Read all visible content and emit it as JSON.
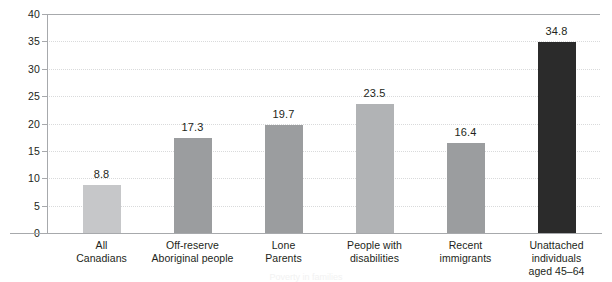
{
  "chart_data": {
    "type": "bar",
    "title": "",
    "subtitle": "",
    "xlabel": "",
    "ylabel": "",
    "ylim": [
      0,
      40
    ],
    "ytick_step": 5,
    "yticks": [
      "40",
      "35",
      "30",
      "25",
      "20",
      "15",
      "10",
      "5",
      "0"
    ],
    "grid": true,
    "grid_axis": "y",
    "legend": false,
    "categories": [
      "All Canadians",
      "Off-reserve Aboriginal people",
      "Lone Parents",
      "People with disabilities",
      "Recent immigrants",
      "Unattached individuals aged 45–64"
    ],
    "category_lines": [
      [
        "All",
        "Canadians"
      ],
      [
        "Off-reserve",
        "Aboriginal people"
      ],
      [
        "Lone",
        "Parents"
      ],
      [
        "People with",
        "disabilities"
      ],
      [
        "Recent",
        "immigrants"
      ],
      [
        "Unattached individuals",
        "aged 45–64"
      ]
    ],
    "values": [
      8.8,
      17.3,
      19.7,
      23.5,
      16.4,
      34.8
    ],
    "value_labels": [
      "8.8",
      "17.3",
      "19.7",
      "23.5",
      "16.4",
      "34.8"
    ],
    "bar_colors": [
      "#c6c7c9",
      "#9b9d9f",
      "#9b9d9f",
      "#b1b3b5",
      "#9b9d9f",
      "#2b2b2b"
    ]
  },
  "axis": {
    "line_color": "#a7a9ac",
    "grid_color": "#d9dadb",
    "text_color": "#231f20"
  },
  "caption": {
    "partial_text": "Poverty in families"
  }
}
